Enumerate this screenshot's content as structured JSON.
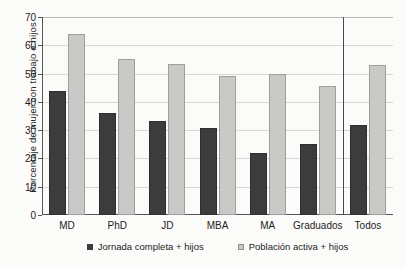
{
  "chart_data": {
    "type": "bar",
    "title": "",
    "xlabel": "",
    "ylabel": "Porcentaje de mujer con trabajo e hijos",
    "ylim": [
      0,
      70
    ],
    "ytick_values": [
      0,
      10,
      20,
      30,
      40,
      50,
      60,
      70
    ],
    "ytick_labels": [
      "0",
      "10",
      "20",
      "30",
      "40",
      "50",
      "60",
      "70"
    ],
    "grid": "horizontal",
    "legend_position": "bottom",
    "categories": [
      "MD",
      "PhD",
      "JD",
      "MBA",
      "MA",
      "Graduados",
      "Todos"
    ],
    "series": [
      {
        "name": "Jornada completa + hijos",
        "color": "#3c3c3c",
        "values": [
          44,
          36,
          33.3,
          30.6,
          22.1,
          25,
          31.8
        ]
      },
      {
        "name": "Población activa + hijos",
        "color": "#c9c9c7",
        "values": [
          64.1,
          55,
          53.4,
          49,
          50,
          45.5,
          53
        ]
      }
    ],
    "annotations": [
      {
        "type": "vertical-separator",
        "after_category": "Graduados",
        "description": "vertical rule separating the Todos group from the degree groups"
      }
    ]
  }
}
